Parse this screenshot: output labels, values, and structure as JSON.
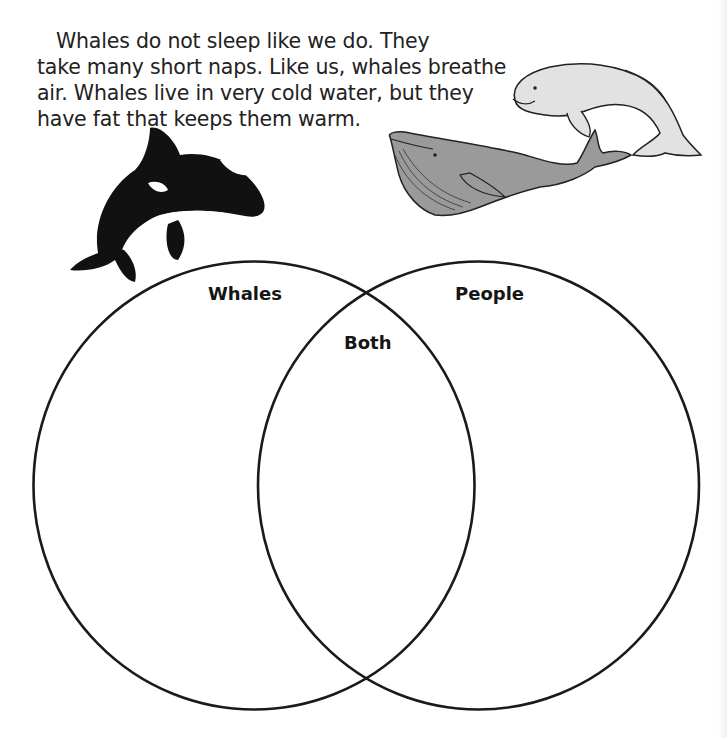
{
  "worksheet": {
    "passage": {
      "lines": [
        "Whales do not sleep like we do. They",
        "take many short naps. Like us, whales breathe",
        "air. Whales live in very cold water, but they",
        "have fat that keeps them warm."
      ]
    },
    "illustrations": [
      {
        "name": "orca-whale-illustration",
        "color": "#111111"
      },
      {
        "name": "beluga-whale-illustration",
        "color": "#e2e2e2"
      },
      {
        "name": "humpback-whale-illustration",
        "color": "#9a9a9a"
      }
    ],
    "venn_diagram": {
      "labels": {
        "left": "Whales",
        "right": "People",
        "overlap": "Both"
      },
      "stroke_color": "#1a1a1a"
    }
  }
}
